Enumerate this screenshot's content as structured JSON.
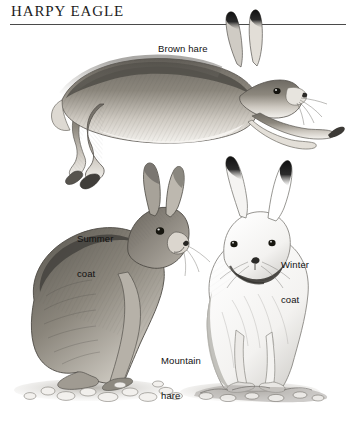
{
  "page": {
    "running_head": "HARPY EAGLE",
    "background_color": "#ffffff",
    "ink_color": "#1d1d1d",
    "width": 352,
    "height": 423
  },
  "labels": {
    "brown_hare": "Brown hare",
    "summer_coat_line1": "Summer",
    "summer_coat_line2": "coat",
    "winter_coat_line1": "Winter",
    "winter_coat_line2": "coat",
    "mountain_hare_line1": "Mountain",
    "mountain_hare_line2": "hare"
  },
  "illustrations": [
    {
      "name": "brown-hare-leaping",
      "subject": "Brown hare",
      "pose": "leaping to the right, body fully extended",
      "coat": "tawny brown with pale underside, black ear tips",
      "medium": "graphite pencil drawing"
    },
    {
      "name": "mountain-hare-summer-coat",
      "subject": "Mountain hare",
      "pose": "sitting upright, facing right",
      "coat": "grey-brown summer coat",
      "medium": "graphite pencil drawing"
    },
    {
      "name": "mountain-hare-winter-coat",
      "subject": "Mountain hare",
      "pose": "sitting upright, facing the viewer",
      "coat": "white winter coat with black ear tips",
      "medium": "graphite pencil drawing"
    }
  ]
}
